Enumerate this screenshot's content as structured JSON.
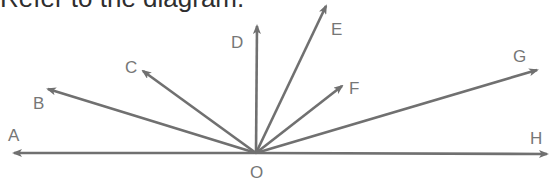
{
  "title": "Refer to the diagram.",
  "diagram": {
    "colors": {
      "line": "#707070",
      "label": "#767676",
      "title": "#2e2e2e"
    },
    "origin": {
      "label": "O",
      "x": 256,
      "y": 153,
      "label_x": 250,
      "label_y": 178
    },
    "rays": [
      {
        "label": "A",
        "tip": [
          14,
          153
        ],
        "label_pos": [
          8,
          141
        ]
      },
      {
        "label": "B",
        "tip": [
          48,
          89
        ],
        "label_pos": [
          33,
          109
        ]
      },
      {
        "label": "C",
        "tip": [
          143,
          71
        ],
        "label_pos": [
          125,
          73
        ]
      },
      {
        "label": "D",
        "tip": [
          257,
          26
        ],
        "label_pos": [
          231,
          48
        ]
      },
      {
        "label": "E",
        "tip": [
          326,
          6
        ],
        "label_pos": [
          331,
          35
        ]
      },
      {
        "label": "F",
        "tip": [
          342,
          86
        ],
        "label_pos": [
          349,
          94
        ]
      },
      {
        "label": "G",
        "tip": [
          537,
          70
        ],
        "label_pos": [
          513,
          62
        ]
      },
      {
        "label": "H",
        "tip": [
          547,
          154
        ],
        "label_pos": [
          530,
          144
        ]
      }
    ]
  }
}
